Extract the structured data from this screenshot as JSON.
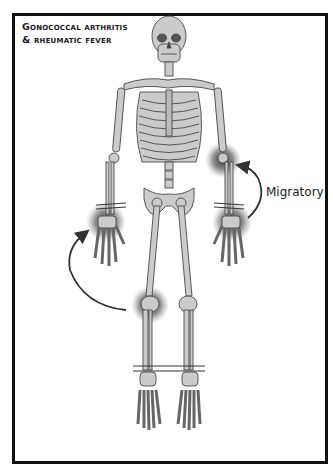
{
  "figure": {
    "title_lines": [
      "Gonococcal arthritis",
      "& rheumatic fever"
    ],
    "annotation_label": "Migratory",
    "colors": {
      "bone_fill": "#c8c8c8",
      "bone_stroke": "#4a4a4a",
      "inflammation_glow": "#3a3a3a",
      "arrow": "#333333",
      "frame": "#111111",
      "background": "#ffffff"
    },
    "highlighted_joints": [
      {
        "name": "left-elbow",
        "side": "viewer-right"
      },
      {
        "name": "left-wrist",
        "side": "viewer-right"
      },
      {
        "name": "right-wrist",
        "side": "viewer-left"
      },
      {
        "name": "right-knee",
        "side": "viewer-left"
      }
    ],
    "arrows": [
      {
        "name": "migratory-arrow-right",
        "from": "left-wrist",
        "to": "left-elbow"
      },
      {
        "name": "migratory-arrow-left",
        "from": "right-knee",
        "to": "right-wrist"
      }
    ]
  }
}
